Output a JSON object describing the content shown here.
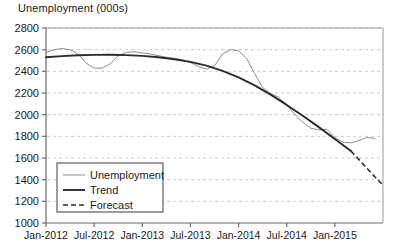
{
  "chart_data": {
    "type": "line",
    "title": "Unemployment (000s)",
    "xlabel": "",
    "ylabel": "",
    "ylim": [
      1000,
      2800
    ],
    "ytick_step": 200,
    "yticks": [
      1000,
      1200,
      1400,
      1600,
      1800,
      2000,
      2200,
      2400,
      2600,
      2800
    ],
    "xticks": [
      "Jan-2012",
      "Jul-2012",
      "Jan-2013",
      "Jul-2013",
      "Jan-2014",
      "Jul-2014",
      "Jan-2015"
    ],
    "grid": "horizontal-dashed",
    "legend_position": "lower-left-inside",
    "series": [
      {
        "name": "Unemployment",
        "style": "solid-thin-gray",
        "color": "#8c8c8c",
        "x": [
          0,
          1,
          2,
          3,
          4,
          5,
          6,
          7,
          8,
          9,
          10,
          11,
          12,
          13,
          14,
          15,
          16,
          17,
          18,
          19,
          20,
          21,
          22,
          23,
          24,
          25,
          26,
          27,
          28,
          29,
          30,
          31,
          32,
          33,
          34,
          35,
          36,
          37,
          38,
          39,
          40,
          41
        ],
        "values": [
          2575,
          2600,
          2610,
          2600,
          2560,
          2475,
          2430,
          2430,
          2470,
          2545,
          2575,
          2580,
          2570,
          2560,
          2545,
          2530,
          2520,
          2505,
          2480,
          2445,
          2420,
          2450,
          2560,
          2600,
          2590,
          2520,
          2380,
          2250,
          2195,
          2160,
          2090,
          2005,
          1930,
          1875,
          1860,
          1865,
          1790,
          1745,
          1740,
          1760,
          1790,
          1780
        ]
      },
      {
        "name": "Trend",
        "style": "solid-thick-black",
        "color": "#2b2b2b",
        "x": [
          0,
          2,
          4,
          6,
          8,
          10,
          12,
          14,
          16,
          18,
          20,
          22,
          24,
          26,
          28,
          30,
          32,
          34,
          36,
          38
        ],
        "values": [
          2530,
          2540,
          2548,
          2552,
          2553,
          2550,
          2543,
          2530,
          2512,
          2487,
          2452,
          2405,
          2345,
          2270,
          2185,
          2090,
          1990,
          1885,
          1775,
          1665
        ]
      },
      {
        "name": "Forecast",
        "style": "dashed-black",
        "color": "#2b2b2b",
        "x": [
          38,
          39,
          40,
          41,
          42
        ],
        "values": [
          1665,
          1585,
          1505,
          1425,
          1350
        ]
      }
    ]
  },
  "legend": {
    "items": [
      {
        "label": "Unemployment",
        "style": "solid-thin-gray"
      },
      {
        "label": "Trend",
        "style": "solid-thick-black"
      },
      {
        "label": "Forecast",
        "style": "dashed-black"
      }
    ]
  },
  "colors": {
    "unemployment": "#8c8c8c",
    "trend": "#2b2b2b",
    "forecast": "#2b2b2b",
    "axis": "#6b6b6b",
    "grid": "#c8c8c8",
    "background": "#ffffff"
  }
}
